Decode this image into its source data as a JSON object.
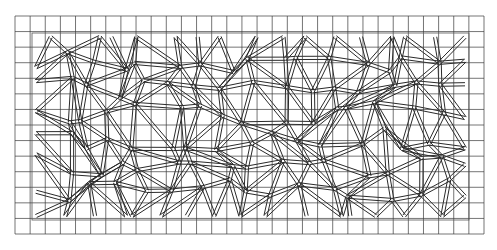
{
  "drawing": {
    "type": "crazy-paving-pattern-on-grid",
    "background": "#ffffff",
    "line_color": "#2a2a2a",
    "grid_color": "#3a3a3a",
    "grid": {
      "x0": 15,
      "y0": 16,
      "x1": 484,
      "y1": 234,
      "cols": 31,
      "rows": 14
    },
    "border": {
      "x": 32,
      "y": 33,
      "w": 437,
      "h": 187
    }
  }
}
